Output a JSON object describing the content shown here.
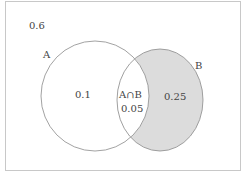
{
  "diagram": {
    "type": "venn",
    "sets": [
      {
        "name": "A",
        "label": "A",
        "only_value": "0.1"
      },
      {
        "name": "B",
        "label": "B",
        "only_value": "0.25",
        "shaded": true
      }
    ],
    "intersection": {
      "label": "A∩B",
      "value": "0.05"
    },
    "outside_value": "0.6",
    "colors": {
      "outline": "#8a8a8a",
      "shade": "#dcdcdc",
      "frame": "#c8c8c8",
      "text": "#444444"
    }
  }
}
